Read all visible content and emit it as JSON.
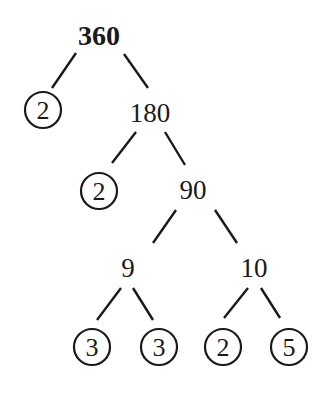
{
  "diagram": {
    "type": "factor-tree",
    "root": "360",
    "nodes": [
      {
        "id": "n360",
        "label": "360",
        "prime": false,
        "bold": true,
        "x": 99,
        "y": 45
      },
      {
        "id": "p2a",
        "label": "2",
        "prime": true,
        "x": 43,
        "y": 110
      },
      {
        "id": "n180",
        "label": "180",
        "prime": false,
        "x": 150,
        "y": 122
      },
      {
        "id": "p2b",
        "label": "2",
        "prime": true,
        "x": 99,
        "y": 191
      },
      {
        "id": "n90",
        "label": "90",
        "prime": false,
        "x": 193,
        "y": 199
      },
      {
        "id": "n9",
        "label": "9",
        "prime": false,
        "x": 128,
        "y": 277
      },
      {
        "id": "n10",
        "label": "10",
        "prime": false,
        "x": 254,
        "y": 277
      },
      {
        "id": "p3a",
        "label": "3",
        "prime": true,
        "x": 92,
        "y": 347
      },
      {
        "id": "p3b",
        "label": "3",
        "prime": true,
        "x": 159,
        "y": 347
      },
      {
        "id": "p2c",
        "label": "2",
        "prime": true,
        "x": 223,
        "y": 347
      },
      {
        "id": "p5",
        "label": "5",
        "prime": true,
        "x": 289,
        "y": 347
      }
    ],
    "edges": [
      {
        "from": "n360",
        "to": "p2a",
        "x1": 76,
        "y1": 53,
        "x2": 52,
        "y2": 88
      },
      {
        "from": "n360",
        "to": "n180",
        "x1": 124,
        "y1": 54,
        "x2": 148,
        "y2": 88
      },
      {
        "from": "n180",
        "to": "p2b",
        "x1": 136,
        "y1": 132,
        "x2": 112,
        "y2": 163
      },
      {
        "from": "n180",
        "to": "n90",
        "x1": 165,
        "y1": 132,
        "x2": 185,
        "y2": 165
      },
      {
        "from": "n90",
        "to": "n9",
        "x1": 176,
        "y1": 210,
        "x2": 153,
        "y2": 243
      },
      {
        "from": "n90",
        "to": "n10",
        "x1": 215,
        "y1": 210,
        "x2": 237,
        "y2": 243
      },
      {
        "from": "n9",
        "to": "p3a",
        "x1": 121,
        "y1": 288,
        "x2": 97,
        "y2": 320
      },
      {
        "from": "n9",
        "to": "p3b",
        "x1": 133,
        "y1": 288,
        "x2": 153,
        "y2": 320
      },
      {
        "from": "n10",
        "to": "p2c",
        "x1": 248,
        "y1": 288,
        "x2": 224,
        "y2": 318
      },
      {
        "from": "n10",
        "to": "p5",
        "x1": 261,
        "y1": 288,
        "x2": 280,
        "y2": 318
      }
    ],
    "prime_factors": [
      "2",
      "2",
      "3",
      "3",
      "2",
      "5"
    ],
    "colors": {
      "ink": "#1a1a1a",
      "background": "#ffffff"
    }
  }
}
